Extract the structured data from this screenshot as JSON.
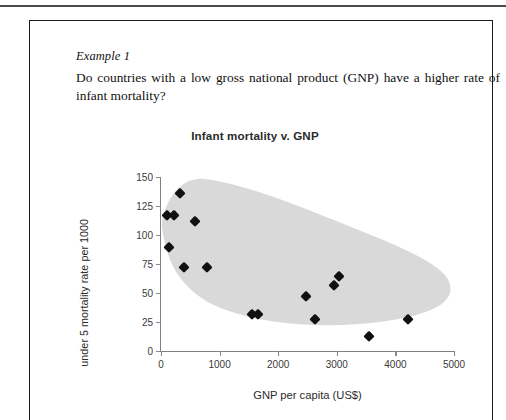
{
  "page": {
    "example_label": "Example 1",
    "question": "Do countries with a low gross national product (GNP) have a higher rate of infant mortality?"
  },
  "chart_data": {
    "type": "scatter",
    "title": "Infant mortality v. GNP",
    "xlabel": "GNP per capita (US$)",
    "ylabel": "under 5 mortality rate per 1000",
    "xlim": [
      0,
      5000
    ],
    "ylim": [
      0,
      150
    ],
    "xticks": [
      0,
      1000,
      2000,
      3000,
      4000,
      5000
    ],
    "yticks": [
      0,
      25,
      50,
      75,
      100,
      125,
      150
    ],
    "grid": false,
    "legend": "none",
    "marker": "filled-diamond",
    "marker_color": "#101010",
    "annotation": {
      "name": "shaded-trend-band",
      "shape": "crescent",
      "color": "#d9d9d9",
      "description": "grey shaded band enclosing the points showing a decreasing trend"
    },
    "points": [
      {
        "x": 325,
        "y": 136
      },
      {
        "x": 100,
        "y": 117
      },
      {
        "x": 220,
        "y": 117
      },
      {
        "x": 580,
        "y": 112
      },
      {
        "x": 135,
        "y": 90
      },
      {
        "x": 390,
        "y": 72
      },
      {
        "x": 785,
        "y": 72
      },
      {
        "x": 1555,
        "y": 32
      },
      {
        "x": 1660,
        "y": 32
      },
      {
        "x": 2475,
        "y": 47
      },
      {
        "x": 2630,
        "y": 28
      },
      {
        "x": 2955,
        "y": 57
      },
      {
        "x": 3040,
        "y": 65
      },
      {
        "x": 3550,
        "y": 13
      },
      {
        "x": 4215,
        "y": 28
      }
    ]
  }
}
